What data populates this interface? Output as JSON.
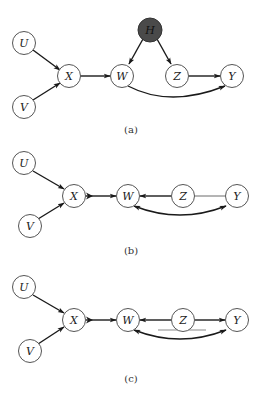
{
  "figure": {
    "panels": [
      {
        "id": "a",
        "caption": "(a)",
        "nodes": {
          "U": {
            "label": "U"
          },
          "V": {
            "label": "V"
          },
          "X": {
            "label": "X"
          },
          "W": {
            "label": "W"
          },
          "H": {
            "label": "H",
            "latent": true
          },
          "Z": {
            "label": "Z"
          },
          "Y": {
            "label": "Y"
          }
        },
        "edges": [
          {
            "from": "U",
            "to": "X",
            "type": "directed"
          },
          {
            "from": "V",
            "to": "X",
            "type": "directed"
          },
          {
            "from": "X",
            "to": "W",
            "type": "directed"
          },
          {
            "from": "H",
            "to": "W",
            "type": "directed"
          },
          {
            "from": "H",
            "to": "Z",
            "type": "directed"
          },
          {
            "from": "Z",
            "to": "Y",
            "type": "directed"
          },
          {
            "from": "W",
            "to": "Y",
            "type": "directed-curved"
          }
        ]
      },
      {
        "id": "b",
        "caption": "(b)",
        "nodes": {
          "U": {
            "label": "U"
          },
          "V": {
            "label": "V"
          },
          "X": {
            "label": "X"
          },
          "W": {
            "label": "W"
          },
          "Z": {
            "label": "Z"
          },
          "Y": {
            "label": "Y"
          }
        },
        "edges": [
          {
            "from": "U",
            "to": "X",
            "type": "directed"
          },
          {
            "from": "V",
            "to": "X",
            "type": "directed"
          },
          {
            "from": "X",
            "to": "W",
            "type": "double-arrowhead"
          },
          {
            "from": "Z",
            "to": "W",
            "type": "directed-thick"
          },
          {
            "from": "Z",
            "to": "Y",
            "type": "undirected"
          },
          {
            "from": "W",
            "to": "Y",
            "type": "bidirected-curved"
          }
        ]
      },
      {
        "id": "c",
        "caption": "(c)",
        "nodes": {
          "U": {
            "label": "U"
          },
          "V": {
            "label": "V"
          },
          "X": {
            "label": "X"
          },
          "W": {
            "label": "W"
          },
          "Z": {
            "label": "Z"
          },
          "Y": {
            "label": "Y"
          }
        },
        "edges": [
          {
            "from": "U",
            "to": "X",
            "type": "directed"
          },
          {
            "from": "V",
            "to": "X",
            "type": "directed"
          },
          {
            "from": "X",
            "to": "W",
            "type": "double-arrowhead"
          },
          {
            "from": "Z",
            "to": "W",
            "type": "directed"
          },
          {
            "from": "Z",
            "to": "Y",
            "type": "directed"
          },
          {
            "from": "W",
            "to": "Y",
            "type": "bidirected-curved"
          }
        ],
        "annotations": [
          {
            "type": "underline-bar",
            "under": [
              "W-Z",
              "Z-Y"
            ]
          }
        ]
      }
    ],
    "colors": {
      "latent_node_fill": "#4a4a4a",
      "node_stroke": "#555555",
      "edge": "#1a1a1a",
      "underline_bar": "#8a8a8a"
    }
  }
}
